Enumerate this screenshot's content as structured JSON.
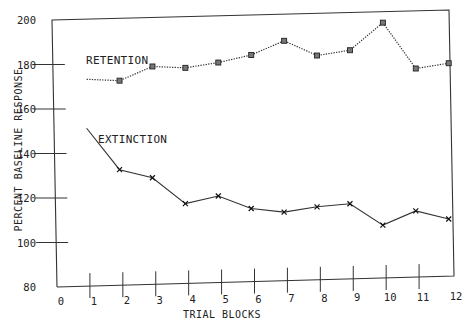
{
  "chart_data": {
    "type": "line",
    "title": "",
    "xlabel": "TRIAL BLOCKS",
    "ylabel": "PERCENT BASELINE RESPONSE",
    "x_ticks": [
      "0",
      "1",
      "2",
      "3",
      "4",
      "5",
      "6",
      "7",
      "8",
      "9",
      "10",
      "11",
      "12"
    ],
    "y_ticks": [
      "80",
      "100",
      "120",
      "140",
      "160",
      "180",
      "200"
    ],
    "xlim": [
      0,
      12
    ],
    "ylim": [
      80,
      200
    ],
    "grid": false,
    "legend": "inline labels",
    "series": [
      {
        "name": "RETENTION",
        "marker": "square",
        "line_style": "dotted",
        "x": [
          0.9,
          1.9,
          2.9,
          3.9,
          4.9,
          5.9,
          6.9,
          7.9,
          8.9,
          9.9,
          10.9,
          11.9
        ],
        "values": [
          173,
          172,
          178,
          177,
          179,
          182,
          188,
          181,
          183,
          195,
          174,
          176
        ]
      },
      {
        "name": "EXTINCTION",
        "marker": "x",
        "line_style": "solid",
        "x": [
          0.9,
          1.9,
          2.9,
          3.9,
          4.9,
          5.9,
          6.9,
          7.9,
          8.9,
          9.9,
          10.9,
          11.9
        ],
        "values": [
          151,
          132,
          128,
          116,
          119,
          113,
          111,
          113,
          114,
          104,
          110,
          106
        ]
      }
    ]
  },
  "labels": {
    "retention": "RETENTION",
    "extinction": "EXTINCTION",
    "xlabel": "TRIAL BLOCKS",
    "ylabel": "PERCENT BASELINE RESPONSE"
  }
}
